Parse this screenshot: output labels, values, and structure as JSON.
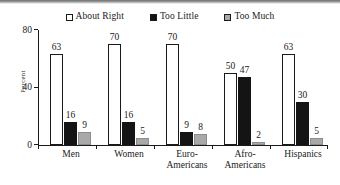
{
  "chart_data": {
    "type": "bar",
    "title": "",
    "xlabel": "",
    "ylabel": "Percent",
    "ylim": [
      0,
      80
    ],
    "yticks": [
      0,
      40,
      80
    ],
    "grid": false,
    "legend_position": "top-center",
    "categories": [
      "Men",
      "Women",
      "Euro-Americans",
      "Afro-Americans",
      "Hispanics"
    ],
    "category_lines": [
      [
        "Men"
      ],
      [
        "Women"
      ],
      [
        "Euro-",
        "Americans"
      ],
      [
        "Afro-",
        "Americans"
      ],
      [
        "Hispanics"
      ]
    ],
    "series": [
      {
        "name": "About Right",
        "color": "#ffffff",
        "values": [
          63,
          70,
          70,
          50,
          63
        ]
      },
      {
        "name": "Too Little",
        "color": "#141414",
        "values": [
          16,
          16,
          9,
          47,
          30
        ]
      },
      {
        "name": "Too Much",
        "color": "#a9a9a9",
        "values": [
          9,
          5,
          8,
          2,
          5
        ]
      }
    ]
  },
  "legend": {
    "items": [
      {
        "label": "About Right",
        "swatch": "open-square-swatch"
      },
      {
        "label": "Too Little",
        "swatch": "filled-black-square-swatch"
      },
      {
        "label": "Too Much",
        "swatch": "gray-square-swatch"
      }
    ]
  },
  "axis": {
    "y_label": "Percent",
    "y_tick_labels": [
      "0",
      "40",
      "80"
    ]
  }
}
